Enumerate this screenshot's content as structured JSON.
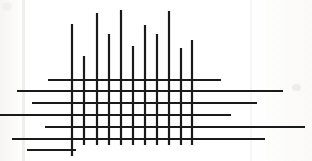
{
  "artwork": {
    "title": "Crossing Lines Composition",
    "description": "Black line drawing of eleven vertical strokes of varying height crossed by seven horizontal strokes of varying length on off-white paper",
    "canvas": {
      "width": 312,
      "height": 161
    },
    "background_color": "#fdfdfc",
    "stroke_color": "#1a1a1a",
    "stroke_width": 2.2
  },
  "chart_data": {
    "type": "line",
    "xlabel": "",
    "ylabel": "",
    "xlim": [
      0,
      312
    ],
    "ylim": [
      0,
      161
    ],
    "grid": false,
    "legend": "none",
    "vertical_lines": [
      {
        "id": "v1",
        "x": 72,
        "y_top": 24,
        "y_bottom": 156,
        "length": 132
      },
      {
        "id": "v2",
        "x": 84,
        "y_top": 56,
        "y_bottom": 145,
        "length": 89
      },
      {
        "id": "v3",
        "x": 97,
        "y_top": 13,
        "y_bottom": 145,
        "length": 132
      },
      {
        "id": "v4",
        "x": 109,
        "y_top": 34,
        "y_bottom": 145,
        "length": 111
      },
      {
        "id": "v5",
        "x": 121,
        "y_top": 10,
        "y_bottom": 145,
        "length": 135
      },
      {
        "id": "v6",
        "x": 133,
        "y_top": 46,
        "y_bottom": 145,
        "length": 99
      },
      {
        "id": "v7",
        "x": 145,
        "y_top": 25,
        "y_bottom": 145,
        "length": 120
      },
      {
        "id": "v8",
        "x": 157,
        "y_top": 34,
        "y_bottom": 145,
        "length": 111
      },
      {
        "id": "v9",
        "x": 169,
        "y_top": 11,
        "y_bottom": 145,
        "length": 134
      },
      {
        "id": "v10",
        "x": 181,
        "y_top": 48,
        "y_bottom": 145,
        "length": 97
      },
      {
        "id": "v11",
        "x": 192,
        "y_top": 40,
        "y_bottom": 145,
        "length": 105
      }
    ],
    "horizontal_lines": [
      {
        "id": "h1",
        "y": 80,
        "x_left": 48,
        "x_right": 221,
        "length": 173
      },
      {
        "id": "h2",
        "y": 91,
        "x_left": 17,
        "x_right": 283,
        "length": 266
      },
      {
        "id": "h3",
        "y": 103,
        "x_left": 32,
        "x_right": 257,
        "length": 225
      },
      {
        "id": "h4",
        "y": 115,
        "x_left": 0,
        "x_right": 231,
        "length": 231
      },
      {
        "id": "h5",
        "y": 127,
        "x_left": 45,
        "x_right": 305,
        "length": 260
      },
      {
        "id": "h6",
        "y": 139,
        "x_left": 12,
        "x_right": 265,
        "length": 253
      },
      {
        "id": "h7",
        "y": 150,
        "x_left": 27,
        "x_right": 76,
        "length": 49
      }
    ],
    "counts": {
      "vertical": 11,
      "horizontal": 7,
      "total": 18
    }
  }
}
